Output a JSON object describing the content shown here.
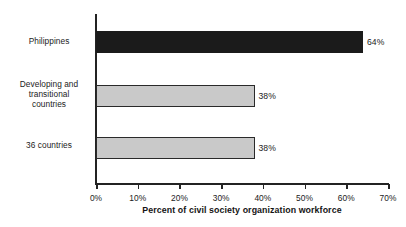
{
  "chart_data": {
    "type": "bar",
    "orientation": "horizontal",
    "title": "",
    "xlabel": "Percent of civil society organization workforce",
    "ylabel": "",
    "categories": [
      "Philippines",
      "Developing and transitional countries",
      "36 countries"
    ],
    "values": [
      64,
      38,
      38
    ],
    "data_labels": [
      "64%",
      "38%",
      "38%"
    ],
    "xlim": [
      0,
      70
    ],
    "xticks": [
      0,
      10,
      20,
      30,
      40,
      50,
      60,
      70
    ],
    "xtick_labels": [
      "0%",
      "10%",
      "20%",
      "30%",
      "40%",
      "50%",
      "60%",
      "70%"
    ],
    "grid": false,
    "legend": false,
    "bar_colors": [
      "#1b1b1b",
      "#c9c9c9",
      "#c9c9c9"
    ]
  },
  "labels": {
    "category_lines": [
      [
        "Philippines"
      ],
      [
        "Developing and",
        "transitional",
        "countries"
      ],
      [
        "36 countries"
      ]
    ]
  },
  "colors": {
    "dark_bar": "#1b1b1b",
    "light_bar": "#c9c9c9",
    "bar_outline": "#2a2a2a",
    "axis": "#232323",
    "text": "#1b1b1b",
    "background": "#ffffff"
  }
}
